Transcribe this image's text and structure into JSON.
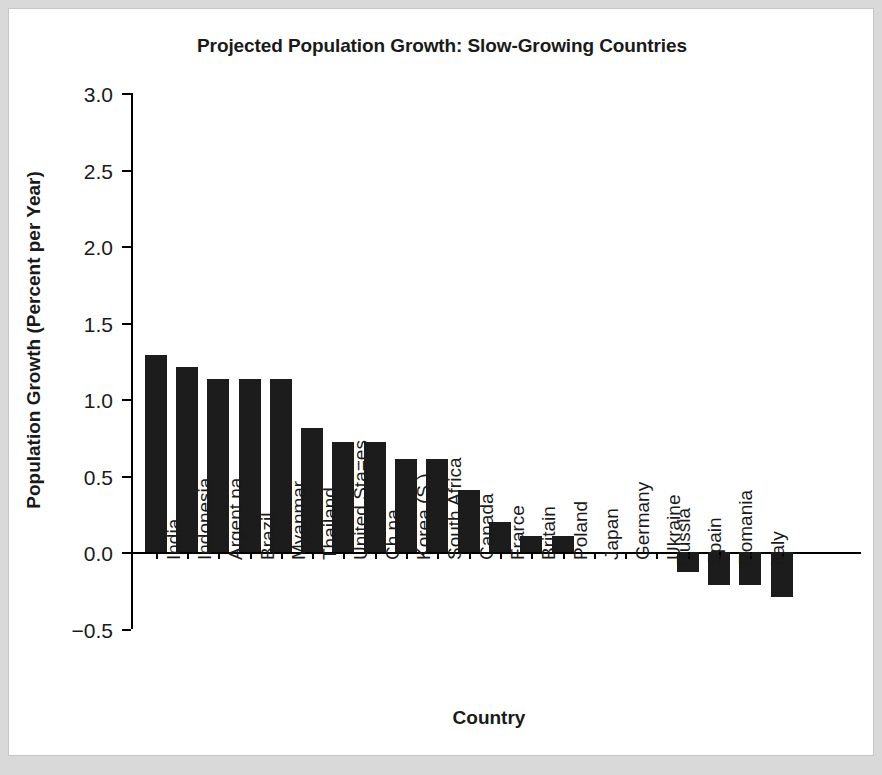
{
  "chart_data": {
    "type": "bar",
    "title": "Projected Population Growth: Slow-Growing Countries",
    "xlabel": "Country",
    "ylabel": "Population Growth (Percent per Year)",
    "ylim": [
      -0.5,
      3.0
    ],
    "ytick_labels": [
      "3.0",
      "2.5",
      "2.0",
      "1.5",
      "1.0",
      "0.5",
      "0.0",
      "−0.5"
    ],
    "ytick_values": [
      3.0,
      2.5,
      2.0,
      1.5,
      1.0,
      0.5,
      0.0,
      -0.5
    ],
    "grid": false,
    "legend": "none",
    "bar_color": "#1c1c1c",
    "categories": [
      "India",
      "Indonesia",
      "Argent na",
      "Brazil",
      "Myanmar",
      "Thailand",
      "United Sta=es",
      "Ch na",
      "Korea (S.)",
      "South Africa",
      "Canada",
      "Frarce",
      "Britain",
      "Poland",
      "Japan",
      "Germany",
      "Ukraine",
      "Russia",
      "Spain",
      "Romania",
      "Italy"
    ],
    "values": [
      1.29,
      1.21,
      1.13,
      1.13,
      1.13,
      0.81,
      0.72,
      0.72,
      0.61,
      0.61,
      0.41,
      0.2,
      0.11,
      0.11,
      0.0,
      0.0,
      0.0,
      -0.13,
      -0.21,
      -0.21,
      -0.29
    ]
  }
}
